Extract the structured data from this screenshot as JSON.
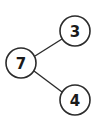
{
  "diagram": {
    "type": "number-bond",
    "whole": {
      "value": "7",
      "cx": 21,
      "cy": 63,
      "r": 15
    },
    "parts": [
      {
        "value": "3",
        "cx": 75,
        "cy": 31,
        "r": 15
      },
      {
        "value": "4",
        "cx": 75,
        "cy": 100,
        "r": 15
      }
    ],
    "edges": [
      {
        "from": "7",
        "to": "3",
        "x1": 35,
        "y1": 56,
        "x2": 62,
        "y2": 39
      },
      {
        "from": "7",
        "to": "4",
        "x1": 34,
        "y1": 71,
        "x2": 62,
        "y2": 92
      }
    ],
    "colors": {
      "stroke": "#2b2b2b",
      "text": "#1a1a1a",
      "background": "#ffffff"
    }
  }
}
